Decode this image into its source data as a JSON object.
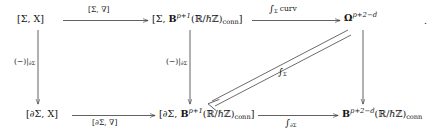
{
  "diagram": {
    "kind": "commutative-diagram",
    "trailing_punctuation": ".",
    "nodes": {
      "top_left": "[Σ, X]",
      "top_mid_prefix": "[Σ, ",
      "top_mid_bold": "B",
      "top_mid_exp": "p+1",
      "top_mid_group": "(ℝ/ℏℤ)",
      "top_mid_sub": "conn",
      "top_mid_suffix": "]",
      "top_right_bold": "Ω",
      "top_right_exp": "p+2−d",
      "bottom_left": "[∂Σ, X]",
      "bottom_mid_prefix": "[∂Σ, ",
      "bottom_mid_bold": "B",
      "bottom_mid_exp": "p+1",
      "bottom_mid_group": "(ℝ/ℏℤ)",
      "bottom_mid_sub": "conn",
      "bottom_mid_suffix": "]",
      "bottom_right_bold": "B",
      "bottom_right_exp": "p+2−d",
      "bottom_right_group": "(ℝ/ℏℤ)",
      "bottom_right_sub": "conn"
    },
    "arrows": {
      "top_left_to_mid": {
        "label_prefix": "[Σ, ",
        "label_symbol": "∇",
        "label_suffix": "]",
        "direction": "right"
      },
      "top_mid_to_right": {
        "label_integral": "∫",
        "label_integral_sub": "Σ",
        "label_text": "curv",
        "direction": "right"
      },
      "bottom_left_to_mid": {
        "label_prefix": "[∂Σ, ",
        "label_symbol": "∇",
        "label_suffix": "]",
        "direction": "right"
      },
      "bottom_mid_to_right": {
        "label_integral": "∫",
        "label_integral_sub": "∂Σ",
        "direction": "right"
      },
      "left_vertical": {
        "label_main": "(−)|",
        "label_sub": "∂Σ",
        "direction": "down"
      },
      "mid_vertical": {
        "label_main": "(−)|",
        "label_sub": "∂Σ",
        "direction": "down"
      },
      "right_vertical": {
        "label_main": "",
        "direction": "down"
      },
      "diagonal_double": {
        "label_integral": "∫",
        "label_integral_sub": "Σ",
        "direction": "down-left",
        "style": "double-line"
      }
    },
    "colors": {
      "ink": "#141414",
      "line": "#3a3a3a",
      "background": "#ffffff"
    }
  }
}
